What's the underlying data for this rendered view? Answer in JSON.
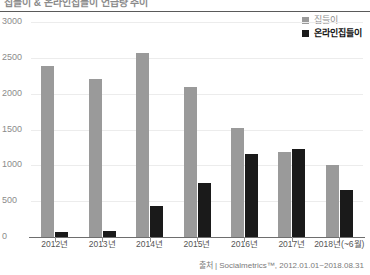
{
  "title": "집들이 & 온라인집들이 언급량 추이",
  "legend": {
    "position": "top-right",
    "items": [
      {
        "label": "집들이",
        "color": "#9a9a9a",
        "key": "series-a"
      },
      {
        "label": "온라인집들이",
        "color": "#1a1a1a",
        "key": "series-b"
      }
    ]
  },
  "source": "출처 | Socialmetrics™, 2012.01.01~2018.08.31",
  "yticks": [
    "0",
    "500",
    "1000",
    "1500",
    "2000",
    "2500",
    "3000"
  ],
  "chart_data": {
    "type": "bar",
    "title": "집들이 & 온라인집들이 언급량 추이",
    "xlabel": "",
    "ylabel": "",
    "ylim": [
      0,
      3000
    ],
    "ytick_values": [
      0,
      500,
      1000,
      1500,
      2000,
      2500,
      3000
    ],
    "grid": true,
    "legend_position": "top-right",
    "categories": [
      "2012년",
      "2013년",
      "2014년",
      "2015년",
      "2016년",
      "2017년",
      "2018년(~6월)"
    ],
    "series": [
      {
        "name": "집들이",
        "color": "#9a9a9a",
        "values": [
          2380,
          2200,
          2570,
          2100,
          1520,
          1180,
          1000
        ]
      },
      {
        "name": "온라인집들이",
        "color": "#1a1a1a",
        "values": [
          70,
          80,
          430,
          750,
          1160,
          1230,
          650
        ]
      }
    ]
  }
}
